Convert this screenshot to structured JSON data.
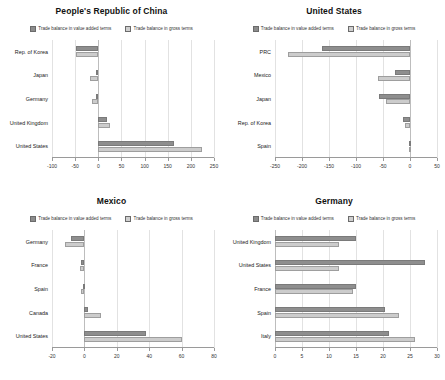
{
  "legend": {
    "value_added_label": "Trade balance in value added terms",
    "gross_label": "Trade balance in gross terms",
    "colors": {
      "value_added": "#8e8e8e",
      "gross": "#cccccc"
    }
  },
  "panels": [
    {
      "id": "prc",
      "title": "People's Republic of China",
      "xmin": -100,
      "xmax": 250,
      "ticks": [
        -100,
        -50,
        0,
        50,
        100,
        150,
        200,
        250
      ],
      "tick_labels": [
        "-100",
        "-50",
        "0",
        "50",
        "100",
        "150",
        "200",
        "250"
      ],
      "categories": [
        "Rep. of Korea",
        "Japan",
        "Germany",
        "United Kingdom",
        "United States"
      ],
      "value_added": [
        -48,
        -4,
        -5,
        19,
        163
      ],
      "gross": [
        -49,
        -17,
        -14,
        26,
        224
      ]
    },
    {
      "id": "usa",
      "title": "United States",
      "xmin": -250,
      "xmax": 50,
      "ticks": [
        -250,
        -200,
        -150,
        -100,
        -50,
        0,
        50
      ],
      "tick_labels": [
        "-250",
        "-200",
        "-150",
        "-100",
        "-50",
        "0",
        "50"
      ],
      "categories": [
        "PRC",
        "Mexico",
        "Japan",
        "Rep. of Korea",
        "Spain"
      ],
      "value_added": [
        -163,
        -27,
        -58,
        -13,
        -2
      ],
      "gross": [
        -226,
        -60,
        -45,
        -9,
        -1
      ]
    },
    {
      "id": "mexico",
      "title": "Mexico",
      "xmin": -20,
      "xmax": 80,
      "ticks": [
        -20,
        0,
        20,
        40,
        60,
        80
      ],
      "tick_labels": [
        "-20",
        "0",
        "20",
        "40",
        "60",
        "80"
      ],
      "categories": [
        "Germany",
        "France",
        "Spain",
        "Canada",
        "United States"
      ],
      "value_added": [
        -8,
        -2,
        -1,
        2,
        38
      ],
      "gross": [
        -12,
        -3,
        -2,
        10,
        60
      ]
    },
    {
      "id": "germany",
      "title": "Germany",
      "xmin": 0,
      "xmax": 30,
      "ticks": [
        0,
        5,
        10,
        15,
        20,
        25,
        30
      ],
      "tick_labels": [
        "0",
        "5",
        "10",
        "15",
        "20",
        "25",
        "30"
      ],
      "categories": [
        "United Kingdom",
        "United States",
        "France",
        "Spain",
        "Italy"
      ],
      "value_added": [
        15,
        27.8,
        15,
        20.4,
        21.2
      ],
      "gross": [
        11.8,
        11.8,
        14.4,
        23,
        26
      ]
    }
  ],
  "chart_data": [
    {
      "type": "bar",
      "title": "People's Republic of China",
      "orientation": "horizontal",
      "categories": [
        "Rep. of Korea",
        "Japan",
        "Germany",
        "United Kingdom",
        "United States"
      ],
      "series": [
        {
          "name": "Trade balance in value added terms",
          "values": [
            -48,
            -4,
            -5,
            19,
            163
          ]
        },
        {
          "name": "Trade balance in gross terms",
          "values": [
            -49,
            -17,
            -14,
            26,
            224
          ]
        }
      ],
      "xlabel": "",
      "ylabel": "",
      "xlim": [
        -100,
        250
      ],
      "grid": true,
      "legend_position": "top"
    },
    {
      "type": "bar",
      "title": "United States",
      "orientation": "horizontal",
      "categories": [
        "PRC",
        "Mexico",
        "Japan",
        "Rep. of Korea",
        "Spain"
      ],
      "series": [
        {
          "name": "Trade balance in value added terms",
          "values": [
            -163,
            -27,
            -58,
            -13,
            -2
          ]
        },
        {
          "name": "Trade balance in gross terms",
          "values": [
            -226,
            -60,
            -45,
            -9,
            -1
          ]
        }
      ],
      "xlabel": "",
      "ylabel": "",
      "xlim": [
        -250,
        50
      ],
      "grid": true,
      "legend_position": "top"
    },
    {
      "type": "bar",
      "title": "Mexico",
      "orientation": "horizontal",
      "categories": [
        "Germany",
        "France",
        "Spain",
        "Canada",
        "United States"
      ],
      "series": [
        {
          "name": "Trade balance in value added terms",
          "values": [
            -8,
            -2,
            -1,
            2,
            38
          ]
        },
        {
          "name": "Trade balance in gross terms",
          "values": [
            -12,
            -3,
            -2,
            10,
            60
          ]
        }
      ],
      "xlabel": "",
      "ylabel": "",
      "xlim": [
        -20,
        80
      ],
      "grid": true,
      "legend_position": "top"
    },
    {
      "type": "bar",
      "title": "Germany",
      "orientation": "horizontal",
      "categories": [
        "United Kingdom",
        "United States",
        "France",
        "Spain",
        "Italy"
      ],
      "series": [
        {
          "name": "Trade balance in value added terms",
          "values": [
            15,
            27.8,
            15,
            20.4,
            21.2
          ]
        },
        {
          "name": "Trade balance in gross terms",
          "values": [
            11.8,
            11.8,
            14.4,
            23,
            26
          ]
        }
      ],
      "xlabel": "",
      "ylabel": "",
      "xlim": [
        0,
        30
      ],
      "grid": true,
      "legend_position": "top"
    }
  ]
}
